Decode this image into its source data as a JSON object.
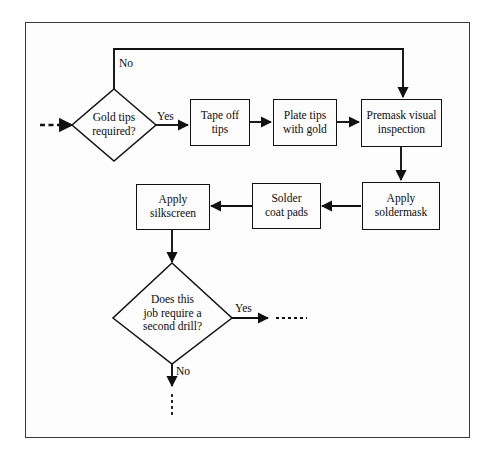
{
  "diagram": {
    "frame": {
      "stroke": "#3a3a3a",
      "fill": "#fdfdfd"
    },
    "ink": "#111111"
  },
  "nodes": {
    "gold_tips_decision": {
      "text": "Gold tips\nrequired?",
      "shape": "diamond"
    },
    "tape_off_tips": {
      "text": "Tape off\ntips",
      "shape": "process"
    },
    "plate_tips_with_gold": {
      "text": "Plate tips\nwith gold",
      "shape": "process"
    },
    "premask_visual_inspection": {
      "text": "Premask visual\ninspection",
      "shape": "process"
    },
    "apply_soldermask": {
      "text": "Apply\nsoldermask",
      "shape": "process"
    },
    "solder_coat_pads": {
      "text": "Solder\ncoat pads",
      "shape": "process"
    },
    "apply_silkscreen": {
      "text": "Apply\nsilkscreen",
      "shape": "process"
    },
    "second_drill_decision": {
      "text": "Does this\njob require a\nsecond drill?",
      "shape": "diamond"
    }
  },
  "edge_labels": {
    "gold_tips_no": "No",
    "gold_tips_yes": "Yes",
    "second_drill_yes": "Yes",
    "second_drill_no": "No"
  }
}
